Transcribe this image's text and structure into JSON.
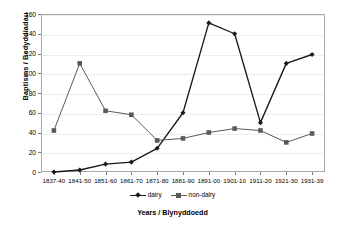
{
  "chart_data": {
    "type": "line",
    "title": "",
    "subtitle": "",
    "xlabel": "Years / Blynyddoedd",
    "ylabel": "Baptisms / Bedyddiadau",
    "categories": [
      "1837-40",
      "1841-50",
      "1851-60",
      "1861-70",
      "1871-80",
      "1881-90",
      "1891-00",
      "1901-10",
      "1911-20",
      "1921-30",
      "1931-39"
    ],
    "series": [
      {
        "name": "dairy",
        "color": "#1a1a1a",
        "marker": "diamond",
        "values": [
          0,
          2,
          8,
          10,
          24,
          60,
          151,
          140,
          50,
          110,
          119
        ]
      },
      {
        "name": "non-dairy",
        "color": "#5a5a5a",
        "marker": "square",
        "values": [
          42,
          110,
          62,
          58,
          32,
          34,
          40,
          44,
          42,
          30,
          39
        ]
      }
    ],
    "ylim": [
      0,
      160
    ],
    "yticks": [
      0,
      20,
      40,
      60,
      80,
      100,
      120,
      140,
      160
    ],
    "ytick_labels": [
      "0",
      "20",
      "40",
      "60",
      "80",
      "100",
      "120",
      "140",
      "160"
    ],
    "grid": true,
    "grid_axis": "y",
    "legend_position": "bottom",
    "plot_background": "#ffffff",
    "frame_color": "#a9a9a9",
    "gridline_color": "#ededed"
  },
  "legend": {
    "items": [
      {
        "label": "dairy"
      },
      {
        "label": "non-dairy"
      }
    ]
  },
  "axes": {
    "y_title": "Baptisms / Bedyddiadau",
    "x_title": "Years / Blynyddoedd"
  }
}
